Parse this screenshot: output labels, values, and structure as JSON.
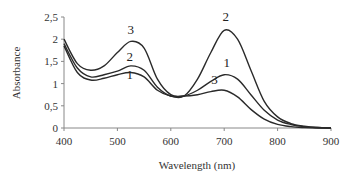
{
  "chart_data": {
    "type": "line",
    "title": "",
    "xlabel": "Wavelength (nm)",
    "ylabel": "Absorbance",
    "xlim": [
      400,
      900
    ],
    "ylim": [
      0,
      2.5
    ],
    "x_ticks": [
      "400",
      "500",
      "600",
      "700",
      "800",
      "900"
    ],
    "y_ticks": [
      "0",
      "0,5",
      "1",
      "1,5",
      "2",
      "2,5"
    ],
    "grid": false,
    "legend": "inline curve labels",
    "x": [
      400,
      425,
      450,
      475,
      500,
      525,
      550,
      575,
      600,
      625,
      650,
      675,
      700,
      725,
      750,
      775,
      800,
      825,
      850,
      875,
      900
    ],
    "series": [
      {
        "name": "1",
        "values": [
          1.85,
          1.25,
          1.08,
          1.12,
          1.2,
          1.25,
          1.15,
          0.85,
          0.72,
          0.72,
          0.85,
          1.05,
          1.2,
          1.1,
          0.75,
          0.4,
          0.18,
          0.08,
          0.03,
          0.01,
          0.0
        ]
      },
      {
        "name": "2",
        "values": [
          1.9,
          1.35,
          1.15,
          1.2,
          1.28,
          1.4,
          1.3,
          0.92,
          0.72,
          0.72,
          1.1,
          1.7,
          2.2,
          2.0,
          1.3,
          0.6,
          0.25,
          0.1,
          0.04,
          0.01,
          0.0
        ]
      },
      {
        "name": "3",
        "values": [
          2.0,
          1.45,
          1.3,
          1.4,
          1.7,
          1.95,
          1.8,
          1.1,
          0.75,
          0.72,
          0.75,
          0.82,
          0.85,
          0.7,
          0.42,
          0.2,
          0.08,
          0.03,
          0.01,
          0.0,
          0.0
        ]
      }
    ],
    "annotations": [
      {
        "text": "3",
        "x": 525,
        "y": 2.12
      },
      {
        "text": "2",
        "x": 523,
        "y": 1.5
      },
      {
        "text": "1",
        "x": 523,
        "y": 1.1
      },
      {
        "text": "2",
        "x": 703,
        "y": 2.4
      },
      {
        "text": "1",
        "x": 705,
        "y": 1.38
      },
      {
        "text": "3",
        "x": 682,
        "y": 0.98
      }
    ]
  }
}
